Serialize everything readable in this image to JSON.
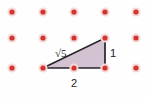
{
  "figure": {
    "canvas": {
      "width": 147,
      "height": 99
    },
    "background_color": "#fefefe"
  },
  "lattice": {
    "name": "dot-grid",
    "dot_color": "#d4342e",
    "halo_color": "#f4d9d8",
    "dot_radius": 2.6,
    "halo_radius": 4.6,
    "columns_x": [
      12,
      43,
      74,
      105,
      136
    ],
    "rows_y": [
      12,
      38,
      68
    ],
    "column_count": 5,
    "row_count": 3,
    "total_dots": 15
  },
  "triangle": {
    "name": "right-triangle",
    "fill_color": "#d3c2d2",
    "stroke_color": "#262528",
    "stroke_width": 1.7,
    "vertices": [
      {
        "name": "bottom-left",
        "x": 43,
        "y": 68
      },
      {
        "name": "bottom-right",
        "x": 105,
        "y": 68
      },
      {
        "name": "top-right",
        "x": 105,
        "y": 38
      }
    ],
    "points_attr": "43,68 105,68 105,38",
    "right_angle_at": "bottom-right"
  },
  "labels": {
    "hypotenuse": {
      "name": "hypotenuse-label",
      "text": "√5",
      "value": "√5",
      "x": 55,
      "y": 57
    },
    "vertical_leg": {
      "name": "vertical-leg-label",
      "text": "1",
      "value": "1",
      "x": 110,
      "y": 57
    },
    "horizontal_leg": {
      "name": "horizontal-leg-label",
      "text": "2",
      "value": "2",
      "x": 71,
      "y": 87
    }
  },
  "chart_data": {
    "type": "diagram",
    "shape": "right triangle",
    "side_labels": [
      "√5",
      "1",
      "2"
    ],
    "legs": [
      {
        "name": "horizontal",
        "label": "2",
        "length": 2
      },
      {
        "name": "vertical",
        "label": "1",
        "length": 1
      }
    ],
    "hypotenuse": {
      "label": "√5",
      "length": 2.236
    },
    "relation": "1^2 + 2^2 = (√5)^2",
    "grid": "5 columns × 3 rows of red lattice dots"
  }
}
